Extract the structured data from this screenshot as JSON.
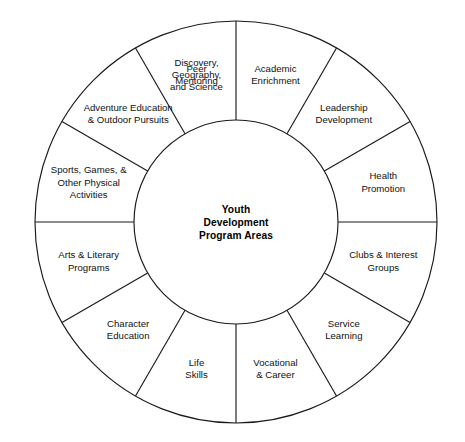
{
  "diagram": {
    "type": "radial-wheel",
    "center": {
      "lines": [
        "Youth",
        "Development",
        "Program Areas"
      ]
    },
    "geometry": {
      "cx": 236,
      "cy": 222,
      "outer_radius": 201,
      "inner_radius": 102,
      "sector_count": 12,
      "sector_angle_degrees": 30,
      "start_angle_degrees": 0
    },
    "colors": {
      "stroke": "#1a1a1a",
      "fill": "#ffffff",
      "text": "#111111"
    },
    "sectors": [
      {
        "index": 0,
        "name": "academic-enrichment",
        "lines": [
          "Academic",
          "Enrichment"
        ]
      },
      {
        "index": 1,
        "name": "leadership-development",
        "lines": [
          "Leadership",
          "Development"
        ]
      },
      {
        "index": 2,
        "name": "health-promotion",
        "lines": [
          "Health",
          "Promotion"
        ]
      },
      {
        "index": 3,
        "name": "clubs-interest-groups",
        "lines": [
          "Clubs & Interest",
          "Groups"
        ]
      },
      {
        "index": 4,
        "name": "service-learning",
        "lines": [
          "Service",
          "Learning"
        ]
      },
      {
        "index": 5,
        "name": "vocational-career",
        "lines": [
          "Vocational",
          "& Career"
        ]
      },
      {
        "index": 6,
        "name": "life-skills",
        "lines": [
          "Life",
          "Skills"
        ]
      },
      {
        "index": 7,
        "name": "character-education",
        "lines": [
          "Character",
          "Education"
        ]
      },
      {
        "index": 8,
        "name": "arts-literary-programs",
        "lines": [
          "Arts & Literary",
          "Programs"
        ]
      },
      {
        "index": 9,
        "name": "sports-games-physical",
        "lines": [
          "Sports, Games, &",
          "Other Physical",
          "Activities"
        ]
      },
      {
        "index": 10,
        "name": "adventure-education",
        "lines": [
          "Adventure Education",
          "& Outdoor Pursuits"
        ]
      },
      {
        "index": 11,
        "name": "discovery-geography-science",
        "lines": [
          "Discovery,",
          "Geography,",
          "and Science"
        ]
      },
      {
        "index": 12,
        "name": "peer-mentoring",
        "lines": [
          "Peer",
          "Mentoring"
        ]
      }
    ]
  }
}
